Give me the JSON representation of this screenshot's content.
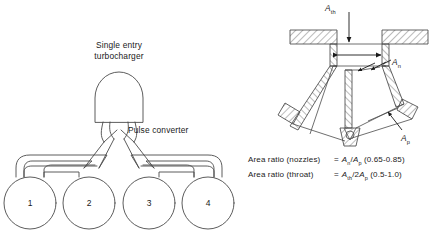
{
  "figure": {
    "left_diagram": {
      "name": "four-cylinder pulse converter manifold",
      "turbocharger_label_line1": "Single entry",
      "turbocharger_label_line2": "turbocharger",
      "pulse_converter_label": "Pulse converter",
      "cylinders": [
        {
          "number": "1"
        },
        {
          "number": "2"
        },
        {
          "number": "3"
        },
        {
          "number": "4"
        }
      ]
    },
    "right_diagram": {
      "name": "pulse converter cross-section",
      "labels": {
        "throat": {
          "symbol": "A",
          "sub": "th"
        },
        "nozzle": {
          "symbol": "A",
          "sub": "n"
        },
        "pipe": {
          "symbol": "A",
          "sub": "p"
        }
      },
      "area_ratios": [
        {
          "name": "Area ratio (nozzles)",
          "equals": "=",
          "numerator": "A",
          "numerator_sub": "n",
          "denominator": "A",
          "denominator_sub": "p",
          "coefficient": "",
          "range": "(0.65-0.85)",
          "expression": "An/Ap (0.65-0.85)"
        },
        {
          "name": "Area ratio (throat)",
          "equals": "=",
          "numerator": "A",
          "numerator_sub": "th",
          "denominator": "A",
          "denominator_sub": "p",
          "coefficient": "2",
          "range": "(0.5-1.0)",
          "expression": "Ath/2Ap (0.5-1.0)"
        }
      ]
    }
  },
  "colors": {
    "line": "#3c3c3c",
    "hatch": "#3c3c3c",
    "text": "#1a1a1a",
    "background": "#ffffff"
  }
}
